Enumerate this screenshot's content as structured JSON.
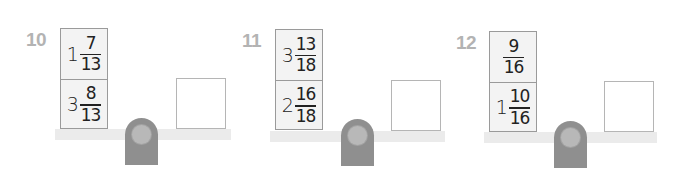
{
  "problems": [
    {
      "number": "10",
      "weights": [
        {
          "whole": "1",
          "numerator": "7",
          "denominator": "13"
        },
        {
          "whole": "3",
          "numerator": "8",
          "denominator": "13"
        }
      ],
      "answer": ""
    },
    {
      "number": "11",
      "weights": [
        {
          "whole": "3",
          "numerator": "13",
          "denominator": "18"
        },
        {
          "whole": "2",
          "numerator": "16",
          "denominator": "18"
        }
      ],
      "answer": ""
    },
    {
      "number": "12",
      "weights": [
        {
          "whole": "",
          "numerator": "9",
          "denominator": "16"
        },
        {
          "whole": "1",
          "numerator": "10",
          "denominator": "16"
        }
      ],
      "answer": ""
    }
  ],
  "colors": {
    "label": "#b3b3b3",
    "beam": "#ebebeb",
    "fulcrum": "#8f8f8f",
    "pivot": "#b8b8b8",
    "weight_box_bg": "#f3f3f3",
    "weight_box_border": "#9a9a9a",
    "text": "#222222"
  }
}
